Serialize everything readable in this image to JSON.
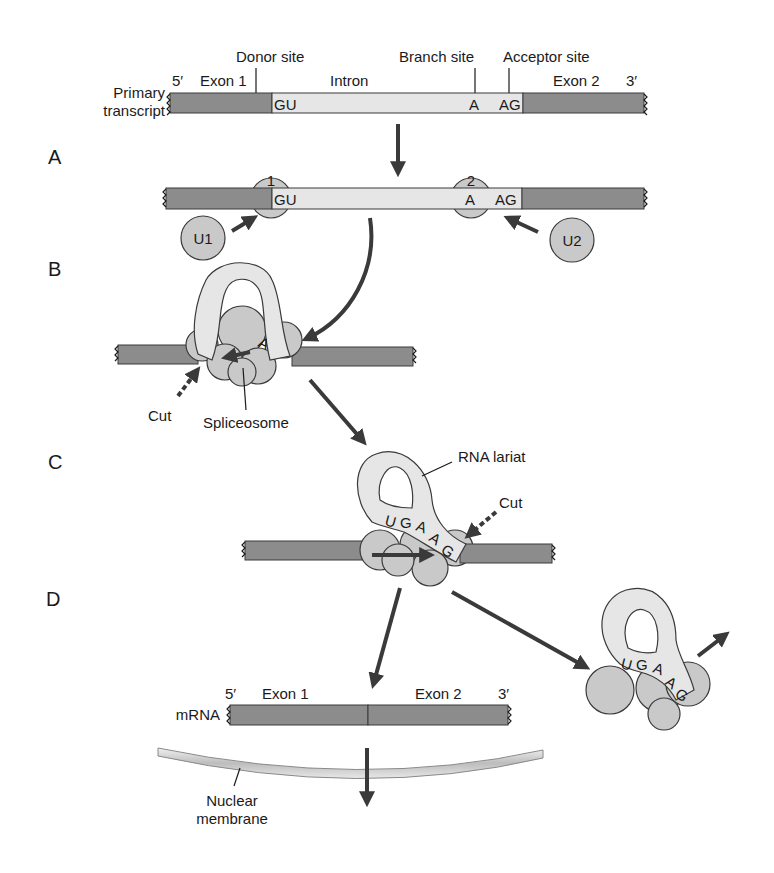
{
  "figure": {
    "colors": {
      "exon": "#8c8c8c",
      "intron": "#e6e6e6",
      "snrnp": "#c9c9c9",
      "outline": "#3a3a3a",
      "arrow": "#3a3a3a"
    }
  },
  "steps": {
    "a": "A",
    "b": "B",
    "c": "C",
    "d": "D"
  },
  "primary": {
    "label_line1": "Primary",
    "label_line2": "transcript",
    "five_prime": "5′",
    "three_prime": "3′",
    "exon1": "Exon 1",
    "intron": "Intron",
    "exon2": "Exon 2",
    "donor_site": "Donor site",
    "branch_site": "Branch site",
    "acceptor_site": "Acceptor site",
    "gu": "GU",
    "a": "A",
    "ag": "AG"
  },
  "step_a": {
    "snrnp1_num": "1",
    "snrnp2_num": "2",
    "u1": "U1",
    "u2": "U2",
    "gu": "GU",
    "a": "A",
    "ag": "AG"
  },
  "step_b": {
    "branch_a": "A",
    "cut": "Cut",
    "spliceosome": "Spliceosome"
  },
  "step_c": {
    "rna_lariat": "RNA lariat",
    "cut": "Cut",
    "bases": [
      "U",
      "G",
      "A",
      "A",
      "G"
    ]
  },
  "step_d": {
    "mrna": "mRNA",
    "five_prime": "5′",
    "three_prime": "3′",
    "exon1": "Exon 1",
    "exon2": "Exon 2",
    "nuclear_membrane_line1": "Nuclear",
    "nuclear_membrane_line2": "membrane",
    "lariat_bases": [
      "U",
      "G",
      "A",
      "A",
      "G"
    ]
  }
}
